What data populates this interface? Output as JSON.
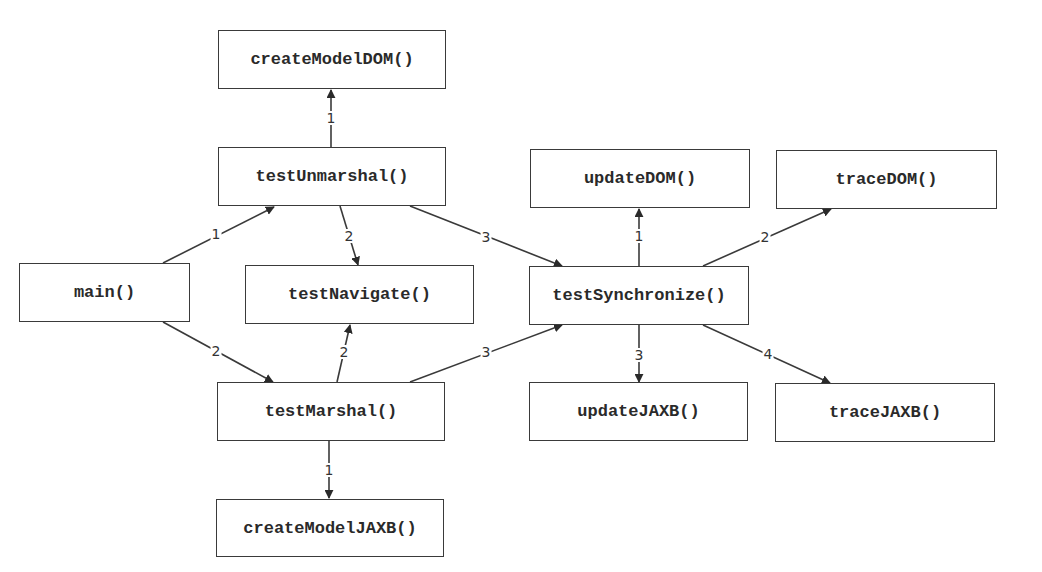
{
  "diagram": {
    "type": "call-graph",
    "nodes": [
      {
        "id": "createModelDOM",
        "label": "createModelDOM()",
        "x": 218,
        "y": 30,
        "w": 228,
        "h": 59
      },
      {
        "id": "testUnmarshal",
        "label": "testUnmarshal()",
        "x": 218,
        "y": 147,
        "w": 228,
        "h": 59
      },
      {
        "id": "main",
        "label": "main()",
        "x": 19,
        "y": 263,
        "w": 171,
        "h": 59
      },
      {
        "id": "testNavigate",
        "label": "testNavigate()",
        "x": 245,
        "y": 265,
        "w": 229,
        "h": 59
      },
      {
        "id": "testMarshal",
        "label": "testMarshal()",
        "x": 217,
        "y": 382,
        "w": 228,
        "h": 59
      },
      {
        "id": "createModelJAXB",
        "label": "createModelJAXB()",
        "x": 216,
        "y": 499,
        "w": 228,
        "h": 58
      },
      {
        "id": "updateDOM",
        "label": "updateDOM()",
        "x": 530,
        "y": 149,
        "w": 220,
        "h": 59
      },
      {
        "id": "traceDOM",
        "label": "traceDOM()",
        "x": 776,
        "y": 150,
        "w": 221,
        "h": 59
      },
      {
        "id": "testSynchronize",
        "label": "testSynchronize()",
        "x": 529,
        "y": 266,
        "w": 220,
        "h": 59
      },
      {
        "id": "updateJAXB",
        "label": "updateJAXB()",
        "x": 529,
        "y": 382,
        "w": 219,
        "h": 59
      },
      {
        "id": "traceJAXB",
        "label": "traceJAXB()",
        "x": 775,
        "y": 383,
        "w": 220,
        "h": 59
      }
    ],
    "edges": [
      {
        "from": "main",
        "to": "testUnmarshal",
        "label": "1",
        "x1": 163,
        "y1": 263,
        "x2": 274,
        "y2": 207,
        "lx": 216,
        "ly": 234
      },
      {
        "from": "main",
        "to": "testMarshal",
        "label": "2",
        "x1": 163,
        "y1": 322,
        "x2": 273,
        "y2": 382,
        "lx": 216,
        "ly": 351
      },
      {
        "from": "testUnmarshal",
        "to": "createModelDOM",
        "label": "1",
        "x1": 331,
        "y1": 147,
        "x2": 331,
        "y2": 90,
        "lx": 331,
        "ly": 118
      },
      {
        "from": "testUnmarshal",
        "to": "testNavigate",
        "label": "2",
        "x1": 340,
        "y1": 206,
        "x2": 358,
        "y2": 265,
        "lx": 349,
        "ly": 236
      },
      {
        "from": "testUnmarshal",
        "to": "testSynchronize",
        "label": "3",
        "x1": 410,
        "y1": 206,
        "x2": 562,
        "y2": 266,
        "lx": 486,
        "ly": 237
      },
      {
        "from": "testMarshal",
        "to": "testNavigate",
        "label": "2",
        "x1": 337,
        "y1": 382,
        "x2": 350,
        "y2": 325,
        "lx": 344,
        "ly": 352
      },
      {
        "from": "testMarshal",
        "to": "testSynchronize",
        "label": "3",
        "x1": 410,
        "y1": 382,
        "x2": 562,
        "y2": 325,
        "lx": 486,
        "ly": 352
      },
      {
        "from": "testMarshal",
        "to": "createModelJAXB",
        "label": "1",
        "x1": 329,
        "y1": 441,
        "x2": 329,
        "y2": 498,
        "lx": 329,
        "ly": 470
      },
      {
        "from": "testSynchronize",
        "to": "updateDOM",
        "label": "1",
        "x1": 639,
        "y1": 266,
        "x2": 639,
        "y2": 209,
        "lx": 639,
        "ly": 236
      },
      {
        "from": "testSynchronize",
        "to": "traceDOM",
        "label": "2",
        "x1": 703,
        "y1": 266,
        "x2": 831,
        "y2": 209,
        "lx": 765,
        "ly": 237
      },
      {
        "from": "testSynchronize",
        "to": "updateJAXB",
        "label": "3",
        "x1": 639,
        "y1": 325,
        "x2": 639,
        "y2": 382,
        "lx": 639,
        "ly": 355
      },
      {
        "from": "testSynchronize",
        "to": "traceJAXB",
        "label": "4",
        "x1": 703,
        "y1": 325,
        "x2": 830,
        "y2": 383,
        "lx": 768,
        "ly": 354
      }
    ],
    "colors": {
      "stroke": "#3a3a3a",
      "text": "#2a2a2a",
      "background": "#ffffff"
    }
  }
}
